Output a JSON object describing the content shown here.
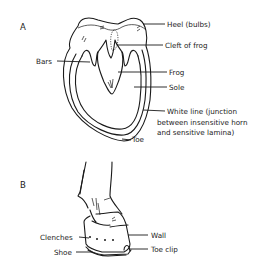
{
  "figure_a": {
    "panel_label": "A",
    "labels": {
      "heel": "Heel (bulbs)",
      "cleft": "Cleft of frog",
      "bars": "Bars",
      "frog": "Frog",
      "sole": "Sole",
      "white_line_1": "White line (junction",
      "white_line_2": "between insensitive horn",
      "white_line_3": "and sensitive lamina)",
      "toe": "Toe"
    }
  },
  "figure_b": {
    "panel_label": "B",
    "labels": {
      "clenches": "Clenches",
      "shoe": "Shoe",
      "wall": "Wall",
      "toe_clip": "Toe clip"
    }
  }
}
